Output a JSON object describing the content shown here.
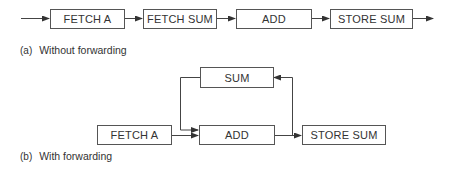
{
  "diagram_a": {
    "caption_tag": "(a)",
    "caption": "Without forwarding",
    "boxes": [
      {
        "label": "FETCH A"
      },
      {
        "label": "FETCH SUM"
      },
      {
        "label": "ADD"
      },
      {
        "label": "STORE SUM"
      }
    ]
  },
  "diagram_b": {
    "caption_tag": "(b)",
    "caption": "With forwarding",
    "boxes": {
      "sum": {
        "label": "SUM"
      },
      "fetch_a": {
        "label": "FETCH A"
      },
      "add": {
        "label": "ADD"
      },
      "store_sum": {
        "label": "STORE SUM"
      }
    }
  },
  "colors": {
    "line": "#444444",
    "box_border": "#555555",
    "text": "#333333"
  }
}
